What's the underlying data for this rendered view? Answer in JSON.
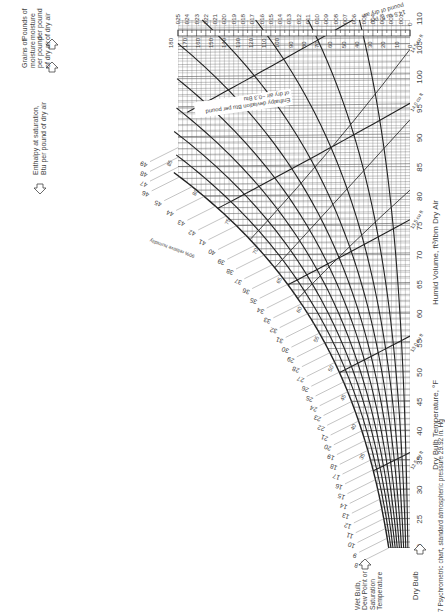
{
  "chart_data": {
    "type": "line",
    "title": "Psychrometric chart, standard atmospheric pressure 29.92 in. Hg",
    "orientation": "rotated 90° clockwise (dry bulb axis along right edge, humidity ratio along top)",
    "xlabel": "Dry Bulb Temperature, °F",
    "x_axis_label_2": "Humid Volume, ft³/lbm Dry Air",
    "ylabel_left": "Pounds of moisture per pound of dry air",
    "ylabel_grains": "Grains of moisture per pound of dry air",
    "enthalpy_label": "Enthalpy at saturation, Btu per pound of dry air",
    "wet_bulb_label": "Wet Bulb, Dew Point or Saturation Temperature",
    "dry_bulb_label": "Dry Bulb",
    "enthalpy_deviation_note": "Enthalpy deviation Btu per pound of dry air −0.3 Btu",
    "volume_note": "14.5 cu ft. per pound of dry air",
    "dry_bulb_ticks": [
      20,
      25,
      30,
      35,
      40,
      45,
      50,
      55,
      60,
      65,
      70,
      75,
      80,
      85,
      90,
      95,
      100,
      105,
      110
    ],
    "humidity_ratio_ticks": [
      ".025",
      ".024",
      ".023",
      ".022",
      ".021",
      ".020",
      ".019",
      ".018",
      ".017",
      ".016",
      ".015",
      ".014",
      ".013",
      ".012",
      ".011",
      ".010",
      ".009",
      ".008",
      ".007",
      ".006",
      ".005",
      ".004",
      ".003",
      ".002",
      ".001",
      "0"
    ],
    "grains_ticks": [
      180,
      170,
      160,
      150,
      140,
      130,
      120,
      110,
      100,
      90,
      80,
      70,
      60,
      50,
      40,
      30,
      20,
      10,
      0
    ],
    "enthalpy_scale_ticks": [
      8,
      9,
      10,
      11,
      12,
      13,
      14,
      15,
      16,
      17,
      18,
      19,
      20,
      21,
      22,
      23,
      24,
      25,
      26,
      27,
      28,
      29,
      30,
      31,
      32,
      33,
      34,
      35,
      36,
      37,
      38,
      39,
      40,
      41,
      42,
      43,
      44,
      45,
      46,
      47,
      48,
      49
    ],
    "wet_bulb_ticks": [
      35,
      40,
      45,
      50,
      55,
      60,
      65,
      70,
      75,
      80,
      85
    ],
    "humid_volume_marks": [
      "12.5",
      "13.0",
      "13.5",
      "14.0",
      "14.5"
    ],
    "relative_humidity_curves_pct": [
      10,
      20,
      30,
      40,
      50,
      60,
      70,
      80,
      90,
      100
    ],
    "dry_bulb_range": [
      20,
      110
    ],
    "humidity_ratio_range": [
      0,
      0.025
    ],
    "grid": true
  },
  "caption": "7  Psychrometric chart, standard atmospheric pressure 29.92 in. Hg",
  "labels": {
    "pounds_moisture": [
      "Pounds of",
      "moisture",
      "per pound",
      "of dry air"
    ],
    "grains_moisture": [
      "Grains of",
      "moisture",
      "per pound",
      "of dry air"
    ],
    "enthalpy_sat": [
      "Enthalpy at saturation,",
      "Btu per pound of dry air"
    ],
    "wet_bulb": [
      "Wet Bulb,",
      "Dew Point or",
      "Saturation",
      "Temperature"
    ],
    "dry_bulb": "Dry Bulb",
    "axis_bottom": "Dry Bulb Temperature, °F",
    "axis_volume": "Humid Volume, ft³/lbm Dry Air",
    "vol_note": [
      "14.5 cu ft. per",
      "pound of dry air"
    ],
    "deviation": [
      "Enthalpy deviation Btu per pound",
      "of dry air −0.3 Btu"
    ],
    "rh_label": "90% relative humidity"
  }
}
